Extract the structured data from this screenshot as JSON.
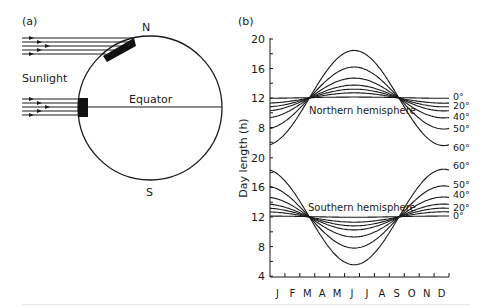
{
  "panel_a": {
    "label": "(a)",
    "north_label": "N",
    "south_label": "S",
    "sunlight_label": "Sunlight",
    "equator_label": "Equator",
    "globe": {
      "cx": 150,
      "cy": 108,
      "r": 72
    },
    "ray_count_per_bundle": 5
  },
  "panel_b": {
    "label": "(b)",
    "ylabel": "Day length (h)",
    "northern_label": "Northern hemisphere",
    "southern_label": "Southern hemisphere"
  },
  "chart_data": {
    "type": "line",
    "title": "",
    "xlabel": "",
    "ylabel": "Day length (h)",
    "x": [
      "J",
      "F",
      "M",
      "A",
      "M",
      "J",
      "J",
      "A",
      "S",
      "O",
      "N",
      "D"
    ],
    "grid": false,
    "legend_position": "right (inline labels at line ends)",
    "panels": [
      {
        "name": "Northern hemisphere",
        "ylim": [
          4,
          20
        ],
        "yticks": [
          8,
          12,
          16,
          20
        ],
        "series": [
          {
            "name": "0°",
            "labeled": true,
            "values": [
              12.0,
              12.0,
              12.1,
              12.1,
              12.1,
              12.1,
              12.1,
              12.1,
              12.1,
              12.0,
              12.0,
              12.0
            ]
          },
          {
            "name": "10°",
            "labeled": false,
            "values": [
              11.4,
              11.6,
              11.9,
              12.2,
              12.5,
              12.7,
              12.6,
              12.4,
              12.1,
              11.8,
              11.5,
              11.3
            ]
          },
          {
            "name": "20°",
            "labeled": true,
            "values": [
              11.0,
              11.3,
              11.8,
              12.4,
              12.9,
              13.2,
              13.1,
              12.7,
              12.1,
              11.6,
              11.1,
              10.8
            ]
          },
          {
            "name": "30°",
            "labeled": false,
            "values": [
              10.4,
              10.9,
              11.7,
              12.6,
              13.3,
              13.7,
              13.6,
              13.0,
              12.2,
              11.3,
              10.6,
              10.2
            ]
          },
          {
            "name": "40°",
            "labeled": true,
            "values": [
              9.6,
              10.4,
              11.6,
              12.9,
              14.0,
              14.7,
              14.4,
              13.5,
              12.2,
              10.9,
              9.8,
              9.3
            ]
          },
          {
            "name": "50°",
            "labeled": true,
            "values": [
              8.0,
              9.3,
              11.3,
              13.3,
              15.2,
              16.2,
              15.9,
              14.4,
              12.3,
              10.3,
              8.6,
              7.8
            ]
          },
          {
            "name": "60°",
            "labeled": true,
            "values": [
              5.8,
              7.8,
              10.9,
              14.0,
              16.9,
              18.5,
              18.0,
              15.5,
              12.4,
              9.4,
              6.8,
              5.6
            ]
          }
        ]
      },
      {
        "name": "Southern hemisphere",
        "ylim": [
          4,
          20
        ],
        "yticks": [
          4,
          8,
          12,
          16,
          20
        ],
        "series": [
          {
            "name": "0°",
            "labeled": true,
            "values": [
              12.1,
              12.1,
              12.0,
              12.0,
              12.0,
              12.0,
              12.0,
              12.0,
              12.0,
              12.1,
              12.1,
              12.1
            ]
          },
          {
            "name": "10°",
            "labeled": false,
            "values": [
              12.6,
              12.4,
              12.1,
              11.8,
              11.5,
              11.3,
              11.4,
              11.6,
              11.9,
              12.2,
              12.5,
              12.7
            ]
          },
          {
            "name": "20°",
            "labeled": true,
            "values": [
              13.0,
              12.7,
              12.2,
              11.6,
              11.1,
              10.8,
              10.9,
              11.3,
              11.9,
              12.4,
              12.9,
              13.2
            ]
          },
          {
            "name": "30°",
            "labeled": false,
            "values": [
              13.6,
              13.1,
              12.3,
              11.4,
              10.7,
              10.3,
              10.4,
              11.0,
              11.8,
              12.7,
              13.4,
              13.8
            ]
          },
          {
            "name": "40°",
            "labeled": true,
            "values": [
              14.4,
              13.6,
              12.4,
              11.1,
              10.0,
              9.3,
              9.6,
              10.5,
              11.8,
              13.1,
              14.2,
              14.7
            ]
          },
          {
            "name": "50°",
            "labeled": true,
            "values": [
              16.0,
              14.7,
              12.7,
              10.7,
              8.8,
              7.8,
              8.1,
              9.6,
              11.7,
              13.7,
              15.4,
              16.2
            ]
          },
          {
            "name": "60°",
            "labeled": true,
            "values": [
              18.2,
              16.2,
              13.1,
              10.0,
              7.1,
              5.7,
              6.0,
              8.5,
              11.6,
              14.6,
              17.2,
              18.4
            ]
          }
        ]
      }
    ],
    "annotations": [
      "Northern hemisphere",
      "Southern hemisphere"
    ]
  },
  "model": {
    "x0": 270,
    "x1": 449,
    "upper": {
      "y12": 98,
      "px_per_h": 7.375,
      "axis_top": 39,
      "axis_bottom": 157
    },
    "lower": {
      "y12": 217,
      "px_per_h": 7.4,
      "axis_top": 158,
      "axis_bottom": 277
    },
    "north_amplitudes": [
      0.08,
      0.7,
      1.2,
      1.75,
      2.7,
      4.2,
      6.45
    ],
    "phase_peak": 0.47
  }
}
